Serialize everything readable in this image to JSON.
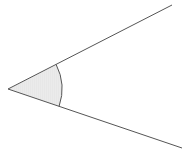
{
  "diagram": {
    "type": "angle",
    "vertex": [
      8,
      89
    ],
    "ray_upper_end": [
      172,
      5
    ],
    "ray_lower_end": [
      182,
      148
    ],
    "arc_radius": 54,
    "colors": {
      "stroke": "#555555",
      "fill": "#ebebeb",
      "background": "#ffffff"
    }
  }
}
